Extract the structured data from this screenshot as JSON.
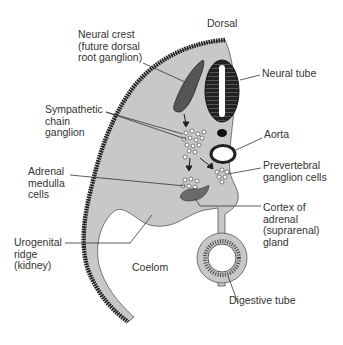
{
  "diagram": {
    "labels": {
      "dorsal": "Dorsal",
      "neural_crest": "Neural crest\n(future dorsal\nroot ganglion)",
      "neural_tube": "Neural tube",
      "sympathetic_chain": "Sympathetic\nchain\nganglion",
      "aorta": "Aorta",
      "prevertebral": "Prevertebral\nganglion cells",
      "adrenal_medulla": "Adrenal\nmedulla\ncells",
      "adrenal_cortex": "Cortex of\nadrenal\n(suprarenal)\ngland",
      "urogenital": "Urogenital\nridge\n(kidney)",
      "coelom": "Coelom",
      "digestive_tube": "Digestive tube"
    },
    "colors": {
      "tissue": "#c8c8c8",
      "ectoderm": "#1e1e1e",
      "neural_crest": "#555555",
      "neural_tube": "#222222",
      "cortex": "#6a6a6a",
      "text": "#333333"
    }
  }
}
